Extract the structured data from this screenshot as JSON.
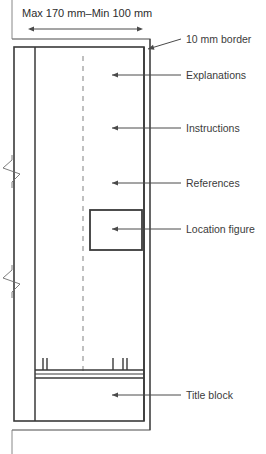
{
  "diagram": {
    "title_dimension": "Max 170 mm–Min 100 mm"
  },
  "callouts": [
    {
      "id": "border",
      "label": "10 mm border",
      "text_x": 186,
      "text_y": 43,
      "leader_x1": 181,
      "leader_y1": 39,
      "leader_x2": 148,
      "leader_y2": 49
    },
    {
      "id": "explanations",
      "label": "Explanations",
      "text_x": 186,
      "text_y": 79,
      "leader_x1": 181,
      "leader_y1": 75,
      "leader_x2": 112,
      "leader_y2": 75
    },
    {
      "id": "instructions",
      "label": "Instructions",
      "text_x": 186,
      "text_y": 132,
      "leader_x1": 181,
      "leader_y1": 128,
      "leader_x2": 112,
      "leader_y2": 128
    },
    {
      "id": "references",
      "label": "References",
      "text_x": 186,
      "text_y": 187,
      "leader_x1": 181,
      "leader_y1": 183,
      "leader_x2": 112,
      "leader_y2": 183
    },
    {
      "id": "location-figure",
      "label": "Location figure",
      "text_x": 186,
      "text_y": 233,
      "leader_x1": 181,
      "leader_y1": 229,
      "leader_x2": 112,
      "leader_y2": 229
    },
    {
      "id": "title-block",
      "label": "Title block",
      "text_x": 186,
      "text_y": 399,
      "leader_x1": 181,
      "leader_y1": 395,
      "leader_x2": 112,
      "leader_y2": 395
    }
  ],
  "geometry": {
    "outer_border": {
      "x": 12,
      "y": 39,
      "w": 138,
      "h": 391
    },
    "inner_frame": {
      "x": 14,
      "y": 47,
      "w": 130,
      "h": 374
    },
    "column_divider_x": 35,
    "centerline_x": 83,
    "location_figure": {
      "x": 90,
      "y": 210,
      "w": 52,
      "h": 40
    },
    "title_block": {
      "x": 35,
      "y": 370,
      "w": 109,
      "h": 51
    },
    "tick_positions": [
      43,
      47,
      113,
      123,
      127
    ],
    "break_marks_y": [
      165,
      275
    ],
    "dimension_line": {
      "x1": 28,
      "x2": 143,
      "y": 29
    }
  },
  "colors": {
    "line": "#4a4a4a",
    "heavy_line": "#3a3a3a",
    "text": "#3b3b3b",
    "background": "#ffffff"
  }
}
